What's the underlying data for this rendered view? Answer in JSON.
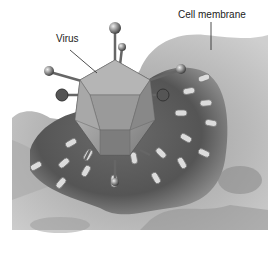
{
  "diagram": {
    "labels": {
      "virus": "Virus",
      "cell_membrane": "Cell membrane"
    },
    "style": "grayscale illustration"
  }
}
